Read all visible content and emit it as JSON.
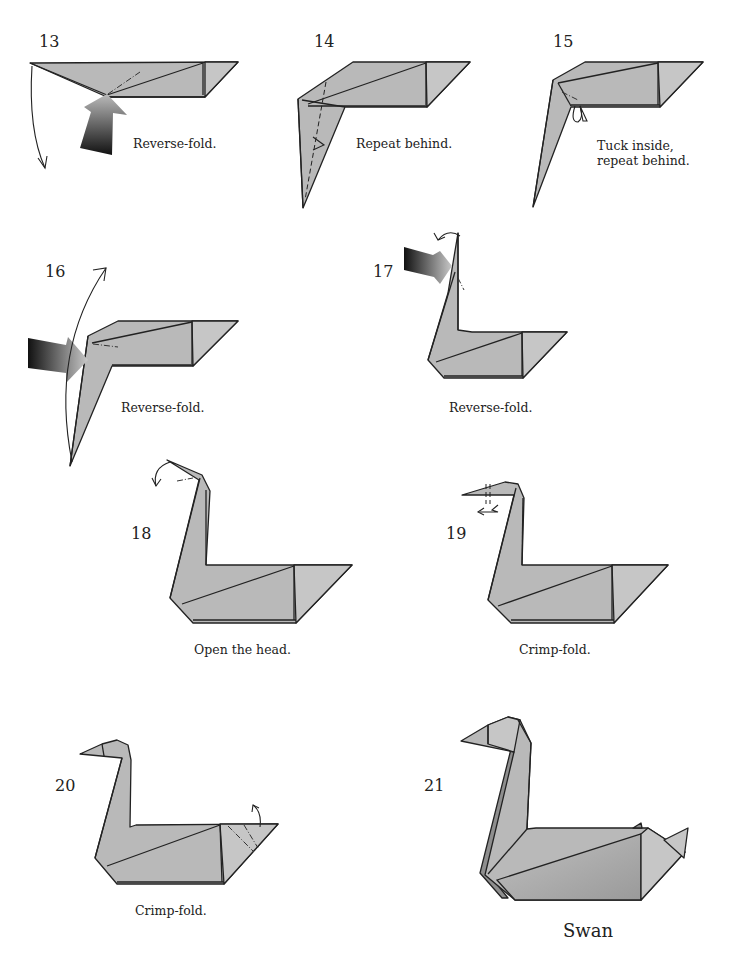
{
  "page": {
    "paper_color": "#b9b9b9",
    "line_color": "#222222",
    "background": "#ffffff"
  },
  "steps": [
    {
      "number": "13",
      "caption": "Reverse-fold.",
      "icons": [
        "push-arrow-icon",
        "curved-arrow-icon"
      ]
    },
    {
      "number": "14",
      "caption": "Repeat behind.",
      "icons": [
        "fold-arrow-icon"
      ]
    },
    {
      "number": "15",
      "caption_line1": "Tuck inside,",
      "caption_line2": "repeat behind.",
      "icons": [
        "tuck-arrow-icon"
      ]
    },
    {
      "number": "16",
      "caption": "Reverse-fold.",
      "icons": [
        "push-arrow-icon",
        "curved-arrow-icon"
      ]
    },
    {
      "number": "17",
      "caption": "Reverse-fold.",
      "icons": [
        "push-arrow-icon",
        "curved-arrow-icon"
      ]
    },
    {
      "number": "18",
      "caption": "Open the head.",
      "icons": [
        "curved-arrow-icon"
      ]
    },
    {
      "number": "19",
      "caption": "Crimp-fold.",
      "icons": [
        "crimp-arrow-icon"
      ]
    },
    {
      "number": "20",
      "caption": "Crimp-fold.",
      "icons": [
        "curved-arrow-icon"
      ]
    },
    {
      "number": "21",
      "caption": "Swan"
    }
  ]
}
